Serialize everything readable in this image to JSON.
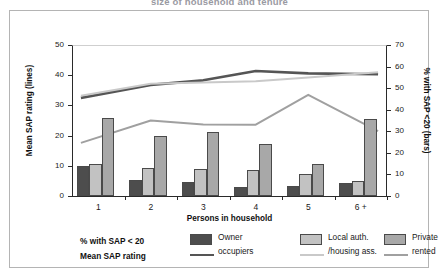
{
  "caption": "size of household and tenure",
  "chart_data": {
    "type": "bar",
    "title": "",
    "xlabel": "Persons in household",
    "ylabel": "Mean SAP rating (lines)",
    "y2label": "% with SAP <20 (bars)",
    "ylim": [
      0,
      50
    ],
    "y2lim": [
      0,
      70
    ],
    "yticks": [
      0,
      10,
      20,
      30,
      40,
      50
    ],
    "y2ticks": [
      0,
      10,
      20,
      30,
      40,
      50,
      60,
      70
    ],
    "grid": false,
    "legend_position": "bottom",
    "categories": [
      "1",
      "2",
      "3",
      "4",
      "5",
      "6 +"
    ],
    "bar_axis": "right",
    "line_axis": "left",
    "bar_series": [
      {
        "name": "Owner occupiers",
        "color": "#4d4d4d",
        "values": [
          14,
          7.5,
          6.5,
          4,
          4.8,
          6
        ]
      },
      {
        "name": "Local auth. /housing ass.",
        "color": "#c2c2c2",
        "values": [
          14.8,
          13,
          12.5,
          12,
          10.3,
          7
        ]
      },
      {
        "name": "Private rented",
        "color": "#a8a8a8",
        "values": [
          36.3,
          28,
          29.5,
          24.3,
          14.8,
          35.8
        ]
      }
    ],
    "line_series": [
      {
        "name": "Owner occupiers",
        "color": "#555555",
        "values": [
          32.5,
          36.8,
          38.3,
          41.4,
          40.6,
          40.3
        ]
      },
      {
        "name": "Local auth. /housing ass.",
        "color": "#c9c9c9",
        "values": [
          33.2,
          37.2,
          37.6,
          38.0,
          39.2,
          41.0
        ]
      },
      {
        "name": "Private rented",
        "color": "#a0a0a0",
        "values": [
          17.6,
          25.0,
          23.7,
          23.6,
          33.5,
          21.5
        ]
      }
    ]
  },
  "axis": {
    "left_title": "Mean SAP rating (lines)",
    "right_title": "% with SAP <20 (bars)",
    "x_title": "Persons in household",
    "left_ticks": [
      "50",
      "40",
      "30",
      "20",
      "10",
      "0"
    ],
    "right_ticks": [
      "70",
      "60",
      "50",
      "40",
      "30",
      "20",
      "10",
      "0"
    ],
    "x_ticks": [
      "1",
      "2",
      "3",
      "4",
      "5",
      "6 +"
    ]
  },
  "legend": {
    "row_label_bars": "% with SAP < 20",
    "row_label_lines": "Mean SAP rating",
    "entries": [
      {
        "line1": "Owner",
        "line2": "occupiers",
        "swatch_color": "#4d4d4d",
        "line_color": "#555555"
      },
      {
        "line1": "Local auth.",
        "line2": "/housing ass.",
        "swatch_color": "#c2c2c2",
        "line_color": "#c9c9c9"
      },
      {
        "line1": "Private",
        "line2": "rented",
        "swatch_color": "#a8a8a8",
        "line_color": "#a0a0a0"
      }
    ]
  }
}
